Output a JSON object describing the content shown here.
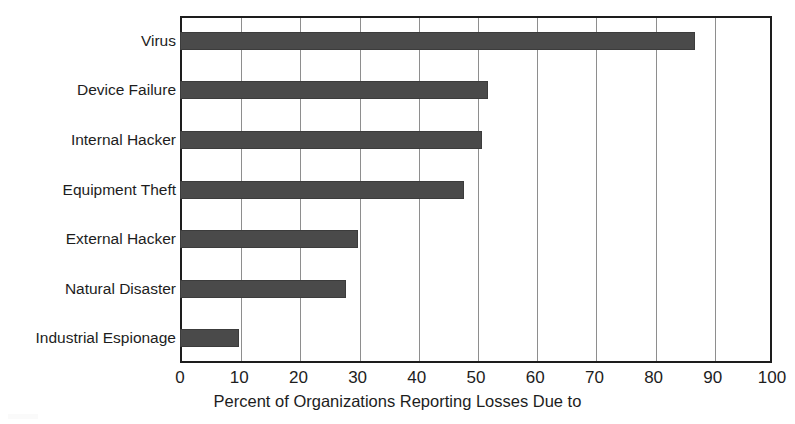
{
  "chart_data": {
    "type": "bar",
    "orientation": "horizontal",
    "title": "",
    "xlabel": "Percent of Organizations Reporting Losses Due to",
    "ylabel": "",
    "categories": [
      "Virus",
      "Device Failure",
      "Internal Hacker",
      "Equipment Theft",
      "External Hacker",
      "Natural Disaster",
      "Industrial Espionage"
    ],
    "values": [
      87,
      52,
      51,
      48,
      30,
      28,
      10
    ],
    "xlim": [
      0,
      100
    ],
    "xticks": [
      0,
      10,
      20,
      30,
      40,
      50,
      60,
      70,
      80,
      90,
      100
    ],
    "xtick_labels": [
      "0",
      "10",
      "20",
      "30",
      "40",
      "50",
      "60",
      "70",
      "80",
      "90",
      "100"
    ],
    "grid": "vertical",
    "legend": "none",
    "bar_color": "#4a4a4a",
    "axis_color": "#1d1d1d",
    "gridline_color": "#8e8e8e",
    "background_color": "#ffffff"
  }
}
